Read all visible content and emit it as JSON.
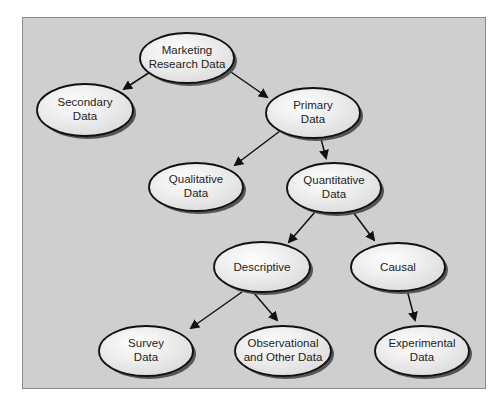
{
  "diagram": {
    "background_color": "#cfcfcf",
    "node_fill": "#f4f4f4",
    "edge_color": "#111111",
    "nodes": [
      {
        "id": "root",
        "lines": [
          "Marketing",
          "Research Data"
        ]
      },
      {
        "id": "secondary",
        "lines": [
          "Secondary",
          "Data"
        ]
      },
      {
        "id": "primary",
        "lines": [
          "Primary",
          "Data"
        ]
      },
      {
        "id": "qualitative",
        "lines": [
          "Qualitative",
          "Data"
        ]
      },
      {
        "id": "quantitative",
        "lines": [
          "Quantitative",
          "Data"
        ]
      },
      {
        "id": "descriptive",
        "lines": [
          "Descriptive"
        ]
      },
      {
        "id": "causal",
        "lines": [
          "Causal"
        ]
      },
      {
        "id": "survey",
        "lines": [
          "Survey",
          "Data"
        ]
      },
      {
        "id": "observational",
        "lines": [
          "Observational",
          "and Other Data"
        ]
      },
      {
        "id": "experimental",
        "lines": [
          "Experimental",
          "Data"
        ]
      }
    ],
    "edges": [
      [
        "root",
        "secondary"
      ],
      [
        "root",
        "primary"
      ],
      [
        "primary",
        "qualitative"
      ],
      [
        "primary",
        "quantitative"
      ],
      [
        "quantitative",
        "descriptive"
      ],
      [
        "quantitative",
        "causal"
      ],
      [
        "descriptive",
        "survey"
      ],
      [
        "descriptive",
        "observational"
      ],
      [
        "causal",
        "experimental"
      ]
    ]
  }
}
